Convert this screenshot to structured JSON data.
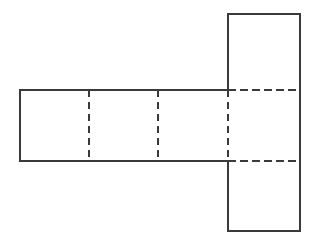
{
  "figure": {
    "name": "net-of-rectangular-prism",
    "background_color": "#ffffff",
    "solid_line_color": "#3a3a3a",
    "dashed_line_color": "#3a3a3a",
    "solid_line_width": 2,
    "dashed_line_width": 2,
    "dash_pattern_vertical": "7 5",
    "dash_pattern_horizontal": "8 4",
    "geometry": {
      "strip_left": 20,
      "strip_right": 300,
      "strip_top": 90,
      "strip_bottom": 161,
      "fold_x_1": 89,
      "fold_x_2": 158,
      "fold_x_3": 228,
      "top_face_top": 14,
      "bottom_face_bottom": 231,
      "right_column_left": 228,
      "right_column_right": 300
    },
    "faces": [
      {
        "id": "face-1",
        "label": "",
        "x": 20,
        "y": 90,
        "w": 69,
        "h": 71
      },
      {
        "id": "face-2",
        "label": "",
        "x": 89,
        "y": 90,
        "w": 69,
        "h": 71
      },
      {
        "id": "face-3",
        "label": "",
        "x": 158,
        "y": 90,
        "w": 70,
        "h": 71
      },
      {
        "id": "face-4",
        "label": "",
        "x": 228,
        "y": 90,
        "w": 72,
        "h": 71
      },
      {
        "id": "face-top",
        "label": "",
        "x": 228,
        "y": 14,
        "w": 72,
        "h": 76
      },
      {
        "id": "face-bottom",
        "label": "",
        "x": 228,
        "y": 161,
        "w": 72,
        "h": 70
      }
    ],
    "solid_segments": [
      {
        "name": "strip-outer-top-left-run",
        "x1": 20,
        "y1": 90,
        "x2": 228,
        "y2": 90
      },
      {
        "name": "strip-outer-bottom-left-run",
        "x1": 20,
        "y1": 161,
        "x2": 228,
        "y2": 161
      },
      {
        "name": "strip-left-edge",
        "x1": 20,
        "y1": 90,
        "x2": 20,
        "y2": 161
      },
      {
        "name": "top-face-top-edge",
        "x1": 228,
        "y1": 14,
        "x2": 300,
        "y2": 14
      },
      {
        "name": "top-face-left-edge",
        "x1": 228,
        "y1": 14,
        "x2": 228,
        "y2": 90
      },
      {
        "name": "right-column-right-edge",
        "x1": 300,
        "y1": 14,
        "x2": 300,
        "y2": 231
      },
      {
        "name": "bottom-face-left-edge",
        "x1": 228,
        "y1": 161,
        "x2": 228,
        "y2": 231
      },
      {
        "name": "bottom-face-bottom-edge",
        "x1": 228,
        "y1": 231,
        "x2": 300,
        "y2": 231
      }
    ],
    "dashed_segments": [
      {
        "name": "fold-vertical-1",
        "x1": 89,
        "y1": 90,
        "x2": 89,
        "y2": 161,
        "orientation": "vertical"
      },
      {
        "name": "fold-vertical-2",
        "x1": 158,
        "y1": 90,
        "x2": 158,
        "y2": 161,
        "orientation": "vertical"
      },
      {
        "name": "fold-vertical-3",
        "x1": 228,
        "y1": 90,
        "x2": 228,
        "y2": 161,
        "orientation": "vertical"
      },
      {
        "name": "fold-horizontal-top",
        "x1": 228,
        "y1": 90,
        "x2": 300,
        "y2": 90,
        "orientation": "horizontal"
      },
      {
        "name": "fold-horizontal-bottom",
        "x1": 228,
        "y1": 161,
        "x2": 300,
        "y2": 161,
        "orientation": "horizontal"
      }
    ]
  }
}
